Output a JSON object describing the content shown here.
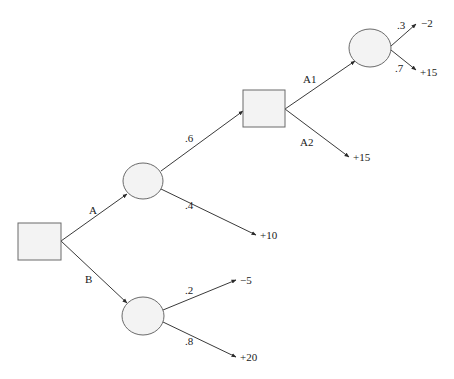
{
  "diagram": {
    "type": "decision-tree",
    "nodes": [
      {
        "id": "d1",
        "kind": "decision",
        "shape": "square",
        "x": 18,
        "y": 223,
        "w": 43,
        "h": 37
      },
      {
        "id": "cA",
        "kind": "chance",
        "shape": "circle",
        "cx": 143,
        "cy": 181,
        "rx": 20,
        "ry": 18
      },
      {
        "id": "cB",
        "kind": "chance",
        "shape": "circle",
        "cx": 143,
        "cy": 316,
        "rx": 21,
        "ry": 19
      },
      {
        "id": "d2",
        "kind": "decision",
        "shape": "square",
        "x": 243,
        "y": 90,
        "w": 42,
        "h": 37
      },
      {
        "id": "cA1",
        "kind": "chance",
        "shape": "circle",
        "cx": 370,
        "cy": 48,
        "rx": 21,
        "ry": 19
      }
    ],
    "edges": [
      {
        "from": "d1",
        "to": "cA",
        "label": "A"
      },
      {
        "from": "d1",
        "to": "cB",
        "label": "B"
      },
      {
        "from": "cA",
        "to": "d2",
        "label": ".6"
      },
      {
        "from": "cA",
        "to": "outcome_plus10",
        "label": ".4"
      },
      {
        "from": "cB",
        "to": "outcome_minus5",
        "label": ".2"
      },
      {
        "from": "cB",
        "to": "outcome_plus20",
        "label": ".8"
      },
      {
        "from": "d2",
        "to": "cA1",
        "label": "A1"
      },
      {
        "from": "d2",
        "to": "outcome_plus15_a2",
        "label": "A2"
      },
      {
        "from": "cA1",
        "to": "outcome_minus2",
        "label": ".3"
      },
      {
        "from": "cA1",
        "to": "outcome_plus15_a1",
        "label": ".7"
      }
    ],
    "labels": {
      "branch_a": "A",
      "branch_b": "B",
      "prob_06": ".6",
      "prob_04": ".4",
      "prob_02": ".2",
      "prob_08": ".8",
      "branch_a1": "A1",
      "branch_a2": "A2",
      "prob_03": ".3",
      "prob_07": ".7"
    },
    "outcomes": {
      "minus2": "−2",
      "plus15_a1": "+15",
      "plus15_a2": "+15",
      "plus10": "+10",
      "minus5": "−5",
      "plus20": "+20"
    }
  }
}
